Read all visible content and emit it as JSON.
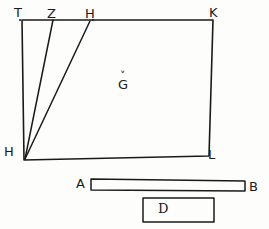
{
  "figure": {
    "ink_color": "#1a1a1a",
    "background_color": "#fdfdfc",
    "labels": {
      "top_left_vertex": "T",
      "top_point_z": "Z",
      "top_point_h": "H",
      "top_right_vertex": "K",
      "interior": "G",
      "interior_diacritic": "˅",
      "bottom_left_vertex": "H",
      "bottom_right_vertex": "L",
      "bar_left": "A",
      "bar_right": "B",
      "box_label": "D"
    },
    "shapes": {
      "quadrilateral": {
        "name": "quadrilateral-TKLH",
        "points": "22,20 213,20 209,156 24,160"
      },
      "diagonal_z_to_h": {
        "name": "line-Z-to-H",
        "x1": 53,
        "y1": 20,
        "x2": 25,
        "y2": 159
      },
      "diagonal_h_to_h": {
        "name": "line-H-to-H",
        "x1": 90,
        "y1": 21,
        "x2": 25,
        "y2": 159
      },
      "bar": {
        "name": "bar-A-B",
        "points": "91,179 245,181 245,191 91,190"
      },
      "box": {
        "name": "box-D",
        "x": 143,
        "y": 198,
        "width": 71,
        "height": 24
      }
    }
  }
}
